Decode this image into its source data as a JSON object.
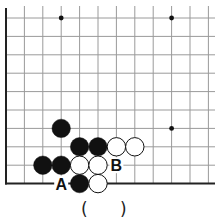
{
  "board": {
    "origin_x": 6,
    "origin_y": 18,
    "spacing": 18.4,
    "cols": 12,
    "rows": 10,
    "right_edge": 215,
    "top_edge": 6,
    "line_color": "#9a9a9a",
    "border_color": "#222222",
    "star_points": [
      [
        3,
        0
      ],
      [
        9,
        0
      ],
      [
        9,
        6
      ]
    ],
    "stones": [
      {
        "color": "black",
        "col": 3,
        "row": 6
      },
      {
        "color": "black",
        "col": 4,
        "row": 7
      },
      {
        "color": "black",
        "col": 5,
        "row": 7
      },
      {
        "color": "white",
        "col": 6,
        "row": 7
      },
      {
        "color": "white",
        "col": 7,
        "row": 7
      },
      {
        "color": "black",
        "col": 2,
        "row": 8
      },
      {
        "color": "black",
        "col": 3,
        "row": 8
      },
      {
        "color": "white",
        "col": 4,
        "row": 8
      },
      {
        "color": "white",
        "col": 5,
        "row": 8
      },
      {
        "color": "black",
        "col": 4,
        "row": 9
      },
      {
        "color": "white",
        "col": 5,
        "row": 9
      }
    ],
    "labels": [
      {
        "text": "B",
        "col": 6,
        "row": 8
      },
      {
        "text": "A",
        "col": 3,
        "row": 9
      }
    ]
  },
  "answer": {
    "open_paren": "(",
    "close_paren": ")"
  }
}
